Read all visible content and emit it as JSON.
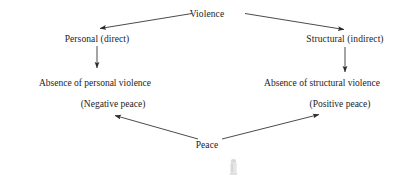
{
  "diagram": {
    "title": "Violence",
    "type": "peace-violence typology flow diagram",
    "nodes": {
      "root": {
        "label": "Violence",
        "x": 207,
        "y": 10
      },
      "left_branch": {
        "label": "Personal (direct)",
        "x": 97,
        "y": 33
      },
      "right_branch": {
        "label": "Structural (indirect)",
        "x": 345,
        "y": 33
      },
      "left_outcome": {
        "line1": "Absence of personal violence",
        "line2": "(Negative peace)",
        "x": 95,
        "y": 78
      },
      "right_outcome": {
        "line1": "Absence of structural violence",
        "line2": "(Positive peace)",
        "x": 320,
        "y": 78
      },
      "bottom": {
        "label": "Peace",
        "x": 207,
        "y": 140
      }
    },
    "edges": [
      {
        "name": "violence-to-personal",
        "from": "root",
        "to": "left_branch",
        "arrowhead": "end",
        "direction": "down-left"
      },
      {
        "name": "violence-to-structural",
        "from": "root",
        "to": "right_branch",
        "arrowhead": "end",
        "direction": "down-right"
      },
      {
        "name": "personal-to-absence-personal",
        "from": "left_branch",
        "to": "left_outcome",
        "arrowhead": "end",
        "direction": "down"
      },
      {
        "name": "structural-to-absence-structural",
        "from": "right_branch",
        "to": "right_outcome",
        "arrowhead": "end",
        "direction": "down"
      },
      {
        "name": "peace-to-negative-peace",
        "from": "bottom",
        "to": "left_outcome",
        "arrowhead": "end",
        "direction": "up-left"
      },
      {
        "name": "peace-to-positive-peace",
        "from": "bottom",
        "to": "right_outcome",
        "arrowhead": "end",
        "direction": "up-right"
      }
    ],
    "colors": {
      "background": "#ffffff",
      "text": "#232323",
      "stroke": "#2b2b2b",
      "cursor_artifact": "#9a9a9a"
    }
  }
}
